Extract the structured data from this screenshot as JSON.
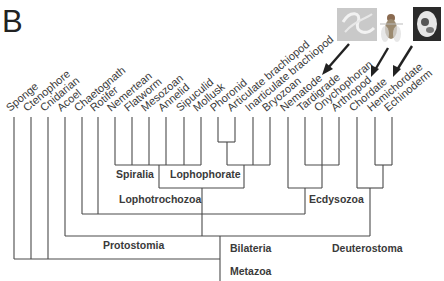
{
  "figure": {
    "panel_label": "B",
    "line_color": "#4a4a4a",
    "text_color": "#3a3a3a"
  },
  "taxa": [
    {
      "name": "Sponge",
      "x": 14
    },
    {
      "name": "Ctenophore",
      "x": 31
    },
    {
      "name": "Cnidarian",
      "x": 48
    },
    {
      "name": "Acoel",
      "x": 65
    },
    {
      "name": "Chaetognath",
      "x": 82
    },
    {
      "name": "Rotifer",
      "x": 98
    },
    {
      "name": "Nemertean",
      "x": 115
    },
    {
      "name": "Flatworm",
      "x": 132
    },
    {
      "name": "Mesozoan",
      "x": 149
    },
    {
      "name": "Annelid",
      "x": 166
    },
    {
      "name": "Sipuculid",
      "x": 184
    },
    {
      "name": "Mollusk",
      "x": 201
    },
    {
      "name": "Phoronid",
      "x": 218
    },
    {
      "name": "Articulate brachiopod",
      "x": 235
    },
    {
      "name": "Inarticulate brachiopod",
      "x": 253
    },
    {
      "name": "Bryozoan",
      "x": 270
    },
    {
      "name": "Nematode",
      "x": 288
    },
    {
      "name": "Tardigrade",
      "x": 305
    },
    {
      "name": "Onychophoran",
      "x": 322
    },
    {
      "name": "Arthropod",
      "x": 339
    },
    {
      "name": "Chordate",
      "x": 357
    },
    {
      "name": "Hemichordate",
      "x": 375
    },
    {
      "name": "Echinoderm",
      "x": 392
    }
  ],
  "clades": {
    "spiralia": "Spiralia",
    "lophophorate": "Lophophorate",
    "lophotrochozoa": "Lophotrochozoa",
    "ecdysozoa": "Ecdysozoa",
    "protostomia": "Protostomia",
    "bilateria": "Bilateria",
    "deuterostoma": "Deuterostoma",
    "metazoa": "Metazoa"
  },
  "images": [
    {
      "subject": "nematode-worm",
      "points_to": "Nematode",
      "bg": "#c9c9c9"
    },
    {
      "subject": "fruit-fly",
      "points_to": "Arthropod",
      "bg": "#ffffff"
    },
    {
      "subject": "vertebrate-embryo",
      "points_to": "Chordate",
      "bg": "#2a2a2a"
    }
  ]
}
